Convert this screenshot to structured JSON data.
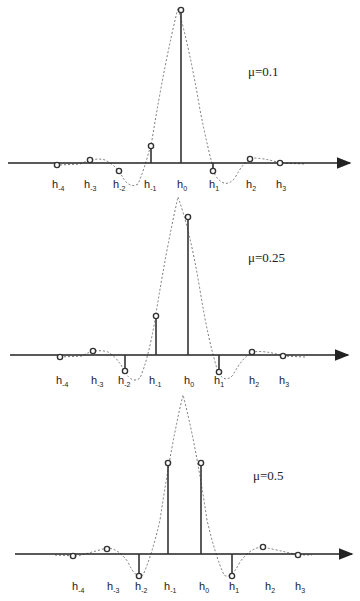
{
  "figure": {
    "labels": [
      "h-4",
      "h-3",
      "h-2",
      "h-1",
      "h0",
      "h1",
      "h2",
      "h3"
    ],
    "panels": [
      {
        "mu_label": "μ=0.1",
        "axis_y": 163,
        "label_y": 188,
        "mu_pos": [
          248,
          76
        ],
        "arrow_x": [
          8,
          350
        ],
        "curve": "M60,165 L80,164 Q95,157 105,160 Q113,164 120,172 Q128,190 138,184 Q145,168 152,140 Q165,60 178,8 Q190,50 200,110 Q208,150 215,175 Q225,190 235,178 Q243,162 252,158 Q265,158 280,163 L305,164",
        "points": [
          {
            "label": "h-4",
            "x": 57,
            "y": 165,
            "stem": false
          },
          {
            "label": "h-3",
            "x": 90,
            "y": 160,
            "stem": false
          },
          {
            "label": "h-2",
            "x": 119,
            "y": 171,
            "stem": false
          },
          {
            "label": "h-1",
            "x": 151,
            "y": 146,
            "stem": true
          },
          {
            "label": "h0",
            "x": 181,
            "y": 10,
            "stem": true
          },
          {
            "label": "h1",
            "x": 213,
            "y": 171,
            "stem": true
          },
          {
            "label": "h2",
            "x": 250,
            "y": 159,
            "stem": false
          },
          {
            "label": "h3",
            "x": 280,
            "y": 163,
            "stem": false
          }
        ],
        "label_x": [
          52,
          84,
          113,
          144,
          177,
          209,
          246,
          276
        ]
      },
      {
        "mu_label": "μ=0.25",
        "axis_y": 355,
        "label_y": 384,
        "mu_pos": [
          248,
          262
        ],
        "arrow_x": [
          10,
          348
        ],
        "curve": "M60,357 L82,356 Q95,348 108,352 Q118,358 125,372 Q132,384 140,378 Q148,360 155,320 Q166,250 178,197 Q190,230 200,290 Q208,340 218,372 Q225,384 233,375 Q242,358 252,352 Q265,350 283,356 L305,357",
        "points": [
          {
            "label": "h-4",
            "x": 60,
            "y": 357,
            "stem": false
          },
          {
            "label": "h-3",
            "x": 93,
            "y": 351,
            "stem": false
          },
          {
            "label": "h-2",
            "x": 125,
            "y": 371,
            "stem": true
          },
          {
            "label": "h-1",
            "x": 156,
            "y": 316,
            "stem": true
          },
          {
            "label": "h0",
            "x": 188,
            "y": 217,
            "stem": true
          },
          {
            "label": "h1",
            "x": 219,
            "y": 372,
            "stem": true
          },
          {
            "label": "h2",
            "x": 252,
            "y": 352,
            "stem": false
          },
          {
            "label": "h3",
            "x": 283,
            "y": 356,
            "stem": false
          }
        ],
        "label_x": [
          56,
          91,
          118,
          149,
          184,
          214,
          249,
          279
        ]
      },
      {
        "mu_label": "μ=0.5",
        "axis_y": 554,
        "label_y": 590,
        "mu_pos": [
          253,
          480
        ],
        "arrow_x": [
          15,
          352
        ],
        "curve": "M55,555 L78,556 Q92,552 107,548 Q118,548 128,562 Q136,580 143,575 Q152,555 160,520 Q172,440 183,395 Q195,440 207,520 Q215,555 224,575 Q231,580 240,562 Q250,548 262,547 Q278,550 298,555 L312,555",
        "points": [
          {
            "label": "h-4",
            "x": 73,
            "y": 556,
            "stem": false
          },
          {
            "label": "h-3",
            "x": 107,
            "y": 549,
            "stem": false
          },
          {
            "label": "h-2",
            "x": 139,
            "y": 576,
            "stem": true
          },
          {
            "label": "h-1",
            "x": 168,
            "y": 463,
            "stem": true
          },
          {
            "label": "h0",
            "x": 201,
            "y": 463,
            "stem": true
          },
          {
            "label": "h1",
            "x": 232,
            "y": 576,
            "stem": true
          },
          {
            "label": "h2",
            "x": 263,
            "y": 547,
            "stem": false
          },
          {
            "label": "h3",
            "x": 298,
            "y": 555,
            "stem": false
          }
        ],
        "label_x": [
          72,
          107,
          135,
          164,
          199,
          229,
          265,
          295
        ]
      }
    ]
  }
}
